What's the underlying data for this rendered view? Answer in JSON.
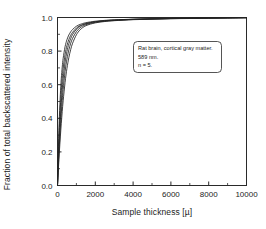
{
  "chart_data": {
    "type": "line",
    "title": "",
    "xlabel": "Sample thickness [µ]",
    "ylabel": "Fraction of total backscattered intensity",
    "xlim": [
      0,
      10000
    ],
    "ylim": [
      0.0,
      1.0
    ],
    "xticks": [
      0,
      2000,
      4000,
      6000,
      8000,
      10000
    ],
    "xticklabels": [
      "0",
      "2000",
      "4000",
      "6000",
      "8000",
      "10000"
    ],
    "yticks": [
      0.0,
      0.2,
      0.4,
      0.6,
      0.8,
      1.0
    ],
    "yticklabels": [
      "0.0",
      "0.2",
      "0.4",
      "0.6",
      "0.8",
      "1.0"
    ],
    "grid": false,
    "legend": false,
    "minor_ticks": true,
    "line_color": "#222222",
    "series": [
      {
        "name": "sample-1",
        "x": [
          0,
          50,
          100,
          150,
          200,
          250,
          300,
          400,
          500,
          600,
          700,
          800,
          1000,
          1200,
          1500,
          2000,
          2500,
          3000,
          4000,
          5000,
          6000,
          7000,
          8000,
          9000,
          10000
        ],
        "values": [
          0.0,
          0.23,
          0.41,
          0.54,
          0.635,
          0.705,
          0.757,
          0.826,
          0.868,
          0.896,
          0.915,
          0.929,
          0.948,
          0.959,
          0.969,
          0.978,
          0.983,
          0.986,
          0.99,
          0.993,
          0.994,
          0.996,
          0.997,
          0.998,
          0.999
        ]
      },
      {
        "name": "sample-2",
        "x": [
          0,
          50,
          100,
          150,
          200,
          250,
          300,
          400,
          500,
          600,
          700,
          800,
          1000,
          1200,
          1500,
          2000,
          2500,
          3000,
          4000,
          5000,
          6000,
          7000,
          8000,
          9000,
          10000
        ],
        "values": [
          0.0,
          0.19,
          0.345,
          0.467,
          0.563,
          0.638,
          0.697,
          0.78,
          0.833,
          0.869,
          0.894,
          0.912,
          0.937,
          0.952,
          0.964,
          0.975,
          0.981,
          0.985,
          0.989,
          0.992,
          0.994,
          0.995,
          0.997,
          0.998,
          0.999
        ]
      },
      {
        "name": "sample-3",
        "x": [
          0,
          50,
          100,
          150,
          200,
          250,
          300,
          400,
          500,
          600,
          700,
          800,
          1000,
          1200,
          1500,
          2000,
          2500,
          3000,
          4000,
          5000,
          6000,
          7000,
          8000,
          9000,
          10000
        ],
        "values": [
          0.0,
          0.155,
          0.287,
          0.398,
          0.492,
          0.57,
          0.635,
          0.733,
          0.798,
          0.843,
          0.875,
          0.899,
          0.93,
          0.948,
          0.962,
          0.974,
          0.98,
          0.984,
          0.989,
          0.992,
          0.994,
          0.995,
          0.997,
          0.998,
          0.999
        ]
      },
      {
        "name": "sample-4",
        "x": [
          0,
          50,
          100,
          150,
          200,
          250,
          300,
          400,
          500,
          600,
          700,
          800,
          1000,
          1200,
          1500,
          2000,
          2500,
          3000,
          4000,
          5000,
          6000,
          7000,
          8000,
          9000,
          10000
        ],
        "values": [
          0.0,
          0.128,
          0.242,
          0.342,
          0.43,
          0.506,
          0.572,
          0.678,
          0.753,
          0.807,
          0.847,
          0.876,
          0.916,
          0.939,
          0.957,
          0.971,
          0.978,
          0.982,
          0.988,
          0.991,
          0.993,
          0.995,
          0.996,
          0.998,
          0.999
        ]
      },
      {
        "name": "sample-5",
        "x": [
          0,
          50,
          100,
          150,
          200,
          250,
          300,
          400,
          500,
          600,
          700,
          800,
          1000,
          1200,
          1500,
          2000,
          2500,
          3000,
          4000,
          5000,
          6000,
          7000,
          8000,
          9000,
          10000
        ],
        "values": [
          0.0,
          0.105,
          0.201,
          0.289,
          0.368,
          0.44,
          0.504,
          0.613,
          0.697,
          0.761,
          0.81,
          0.847,
          0.897,
          0.927,
          0.951,
          0.968,
          0.976,
          0.981,
          0.987,
          0.99,
          0.993,
          0.994,
          0.996,
          0.997,
          0.999
        ]
      }
    ],
    "annotation": {
      "lines": [
        "Rat brain, cortical gray matter.",
        "589 nm.",
        "n = 5."
      ]
    }
  }
}
